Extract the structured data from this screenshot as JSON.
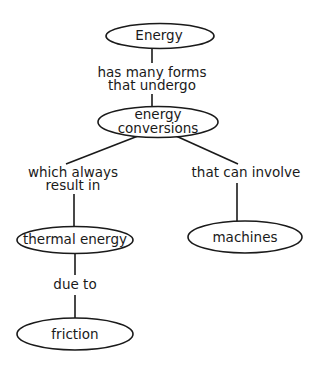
{
  "diagram": {
    "type": "concept-map",
    "colors": {
      "stroke": "#1a1a1a",
      "text": "#1a1a1a",
      "background": "#ffffff"
    },
    "nodes": [
      {
        "id": "energy",
        "label": "Energy",
        "lines": [
          "Energy"
        ]
      },
      {
        "id": "energy-conversions",
        "label": "energy conversions",
        "lines": [
          "energy",
          "conversions"
        ]
      },
      {
        "id": "thermal-energy",
        "label": "thermal energy",
        "lines": [
          "thermal energy"
        ]
      },
      {
        "id": "machines",
        "label": "machines",
        "lines": [
          "machines"
        ]
      },
      {
        "id": "friction",
        "label": "friction",
        "lines": [
          "friction"
        ]
      }
    ],
    "links": [
      {
        "from": "energy",
        "to": "energy-conversions",
        "label": "has many forms that undergo",
        "lines": [
          "has many forms",
          "that undergo"
        ]
      },
      {
        "from": "energy-conversions",
        "to": "thermal-energy",
        "label": "which always result in",
        "lines": [
          "which always",
          "result in"
        ]
      },
      {
        "from": "energy-conversions",
        "to": "machines",
        "label": "that can involve",
        "lines": [
          "that can involve"
        ]
      },
      {
        "from": "thermal-energy",
        "to": "friction",
        "label": "due to",
        "lines": [
          "due to"
        ]
      }
    ]
  }
}
